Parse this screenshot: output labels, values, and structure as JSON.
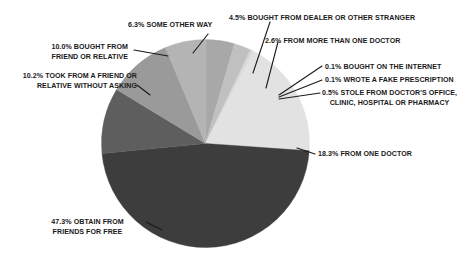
{
  "chart_data": {
    "type": "pie",
    "title": "",
    "subtitle": "",
    "xlabel": "",
    "ylabel": "",
    "legend_position": "none",
    "grid": false,
    "units": "percent",
    "start_angle_deg": 0,
    "direction": "clockwise",
    "categories": [
      "BOUGHT FROM DEALER OR OTHER STRANGER",
      "FROM MORE THAN ONE DOCTOR",
      "BOUGHT ON THE INTERNET",
      "WROTE A FAKE PRESCRIPTION",
      "STOLE FROM DOCTOR'S OFFICE, CLINIC, HOSPITAL OR PHARMACY",
      "FROM ONE DOCTOR",
      "OBTAIN FROM FRIENDS FOR FREE",
      "TOOK FROM A FRIEND OR RELATIVE WITHOUT ASKING",
      "BOUGHT FROM FRIEND OR RELATIVE",
      "SOME OTHER WAY"
    ],
    "values": [
      4.5,
      2.6,
      0.1,
      0.1,
      0.5,
      18.3,
      47.3,
      10.2,
      10.0,
      6.3
    ],
    "colors": [
      "#a8a8a8",
      "#c0c0c0",
      "#d2d2d2",
      "#c8c8c8",
      "#dcdcdc",
      "#e2e2e2",
      "#3d3d3d",
      "#5e5e5e",
      "#9a9a9a",
      "#b4b4b4"
    ],
    "slices": [
      {
        "label": "BOUGHT FROM DEALER OR OTHER STRANGER",
        "value": 4.5,
        "display": "4.5%",
        "color": "#a8a8a8"
      },
      {
        "label": "FROM MORE THAN ONE DOCTOR",
        "value": 2.6,
        "display": "2.6%",
        "color": "#c0c0c0"
      },
      {
        "label": "BOUGHT ON THE INTERNET",
        "value": 0.1,
        "display": "0.1%",
        "color": "#d2d2d2"
      },
      {
        "label": "WROTE A FAKE PRESCRIPTION",
        "value": 0.1,
        "display": "0.1%",
        "color": "#c8c8c8"
      },
      {
        "label": "STOLE FROM DOCTOR'S OFFICE, CLINIC, HOSPITAL OR PHARMACY",
        "value": 0.5,
        "display": "0.5%",
        "color": "#dcdcdc"
      },
      {
        "label": "FROM ONE DOCTOR",
        "value": 18.3,
        "display": "18.3%",
        "color": "#e2e2e2"
      },
      {
        "label": "OBTAIN FROM FRIENDS FOR FREE",
        "value": 47.3,
        "display": "47.3%",
        "color": "#3d3d3d"
      },
      {
        "label": "TOOK FROM A FRIEND OR RELATIVE WITHOUT ASKING",
        "value": 10.2,
        "display": "10.2%",
        "color": "#5e5e5e"
      },
      {
        "label": "BOUGHT FROM FRIEND OR RELATIVE",
        "value": 10.0,
        "display": "10.0%",
        "color": "#9a9a9a"
      },
      {
        "label": "SOME OTHER WAY",
        "value": 6.3,
        "display": "6.3%",
        "color": "#b4b4b4"
      }
    ]
  },
  "callouts": {
    "dealer": {
      "line1": "4.5% BOUGHT FROM DEALER OR OTHER STRANGER"
    },
    "more_than_one_doctor": {
      "line1": "2.6% FROM MORE THAN ONE DOCTOR"
    },
    "internet": {
      "line1": "0.1% BOUGHT ON THE INTERNET"
    },
    "fake_prescription": {
      "line1": "0.1% WROTE A FAKE PRESCRIPTION"
    },
    "stole": {
      "line1": "0.5% STOLE FROM DOCTOR'S OFFICE,",
      "line2": "CLINIC, HOSPITAL OR PHARMACY"
    },
    "one_doctor": {
      "line1": "18.3% FROM ONE DOCTOR"
    },
    "friends_free": {
      "line1": "47.3% OBTAIN FROM",
      "line2": "FRIENDS FOR FREE"
    },
    "took_without_asking": {
      "line1": "10.2% TOOK FROM A FRIEND OR",
      "line2": "RELATIVE WITHOUT ASKING"
    },
    "bought_from_friend": {
      "line1": "10.0% BOUGHT FROM",
      "line2": "FRIEND OR RELATIVE"
    },
    "some_other_way": {
      "line1": "6.3% SOME OTHER WAY"
    }
  },
  "style": {
    "background": "#ffffff",
    "text_color": "#1a1a1a",
    "leader_color": "#1a1a1a"
  }
}
